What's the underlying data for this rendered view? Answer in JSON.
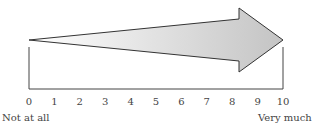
{
  "scale": {
    "min": 0,
    "max": 10,
    "ticks": [
      "0",
      "1",
      "2",
      "3",
      "4",
      "5",
      "6",
      "7",
      "8",
      "9",
      "10"
    ],
    "low_label": "Not at all",
    "high_label": "Very much"
  },
  "arrow": {
    "direction": "right",
    "fill_gradient": [
      "#ffffff",
      "#c4c4c4"
    ],
    "stroke": "#333333"
  }
}
